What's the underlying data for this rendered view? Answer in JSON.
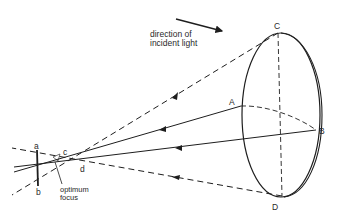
{
  "diagram": {
    "caption_direction": [
      "direction of",
      "incident light"
    ],
    "caption_focus": [
      "optimum",
      "focus"
    ],
    "points": {
      "A": "A",
      "B": "B",
      "C": "C",
      "D": "D",
      "a": "a",
      "b": "b",
      "c": "c",
      "d": "d"
    },
    "colors": {
      "line": "#1e1e1e",
      "background": "#ffffff"
    }
  }
}
